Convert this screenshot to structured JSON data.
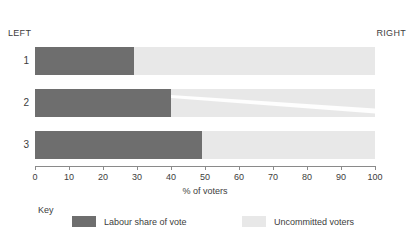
{
  "chart_data": {
    "type": "bar",
    "orientation": "horizontal",
    "stacked": true,
    "title": "",
    "xlabel": "% of voters",
    "ylabel": "",
    "xlim": [
      0,
      100
    ],
    "xticks": [
      0,
      10,
      20,
      30,
      40,
      50,
      60,
      70,
      80,
      90,
      100
    ],
    "xticklabels": [
      "0",
      "10",
      "20",
      "30",
      "40",
      "50",
      "60",
      "70",
      "80",
      "90",
      "100"
    ],
    "grid": false,
    "categories": [
      "1",
      "2",
      "3"
    ],
    "series": [
      {
        "name": "Labour share of vote",
        "values": [
          29,
          40,
          49
        ],
        "color": "#6e6e6e"
      },
      {
        "name": "Uncommitted voters",
        "values": [
          71,
          60,
          51
        ],
        "color": "#e8e8e8"
      }
    ],
    "annotations": {
      "left_axis_label": "LEFT",
      "right_axis_label": "RIGHT"
    },
    "legend": {
      "position": "bottom",
      "title": "Key",
      "entries": [
        {
          "label": "Labour share of vote",
          "color": "#6e6e6e"
        },
        {
          "label": "Uncommitted voters",
          "color": "#e8e8e8"
        }
      ]
    }
  },
  "direction": {
    "left": "LEFT",
    "right": "RIGHT"
  },
  "rows": [
    {
      "label": "1",
      "value": 29
    },
    {
      "label": "2",
      "value": 40
    },
    {
      "label": "3",
      "value": 49
    }
  ],
  "axis": {
    "title": "% of voters",
    "ticks": [
      "0",
      "10",
      "20",
      "30",
      "40",
      "50",
      "60",
      "70",
      "80",
      "90",
      "100"
    ]
  },
  "legend": {
    "title": "Key",
    "labour": "Labour share of vote",
    "uncommitted": "Uncommitted voters"
  },
  "colors": {
    "labour": "#6e6e6e",
    "uncommitted": "#e8e8e8",
    "axis": "#8a8a8a",
    "text": "#3d3d3d"
  }
}
